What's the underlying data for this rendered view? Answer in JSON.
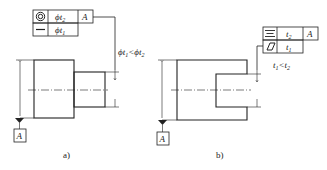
{
  "figure_a": {
    "caption": "a)",
    "frame": {
      "rows": [
        {
          "symbol": "concentricity-icon",
          "value_prefix": "ϕ",
          "value_var": "t",
          "value_sub": "2",
          "datum": "A"
        },
        {
          "symbol": "straightness-icon",
          "value_prefix": "ϕ",
          "value_var": "t",
          "value_sub": "1",
          "datum": ""
        }
      ]
    },
    "condition": {
      "text_1": "ϕt",
      "sub_1": "1",
      "op": "<",
      "text_2": "ϕt",
      "sub_2": "2"
    },
    "datum_label": "A"
  },
  "figure_b": {
    "caption": "b)",
    "frame": {
      "rows": [
        {
          "symbol": "symmetry-icon",
          "value_prefix": "",
          "value_var": "t",
          "value_sub": "2",
          "datum": "A"
        },
        {
          "symbol": "flatness-icon",
          "value_prefix": "",
          "value_var": "t",
          "value_sub": "1",
          "datum": ""
        }
      ]
    },
    "condition": {
      "text_1": "t",
      "sub_1": "1",
      "op": "<",
      "text_2": "t",
      "sub_2": "2"
    },
    "datum_label": "A"
  },
  "colors": {
    "line": "#222222",
    "background": "#ffffff"
  }
}
